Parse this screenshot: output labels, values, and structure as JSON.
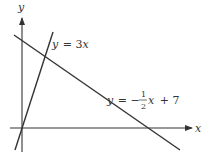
{
  "diagram": {
    "axes": {
      "x_label": "x",
      "y_label": "y"
    },
    "lines": [
      {
        "name": "steep-line",
        "label_var": "y",
        "label_eq": "= 3",
        "label_x": "x",
        "equation": "y = 3x"
      },
      {
        "name": "shallow-line",
        "label_var": "y",
        "label_eq": "= −",
        "frac_num": "1",
        "frac_den": "2",
        "label_x": "x",
        "label_tail": "+ 7",
        "equation": "y = -1/2 x + 7"
      }
    ],
    "colors": {
      "line": "#333333",
      "background": "#ffffff"
    }
  }
}
